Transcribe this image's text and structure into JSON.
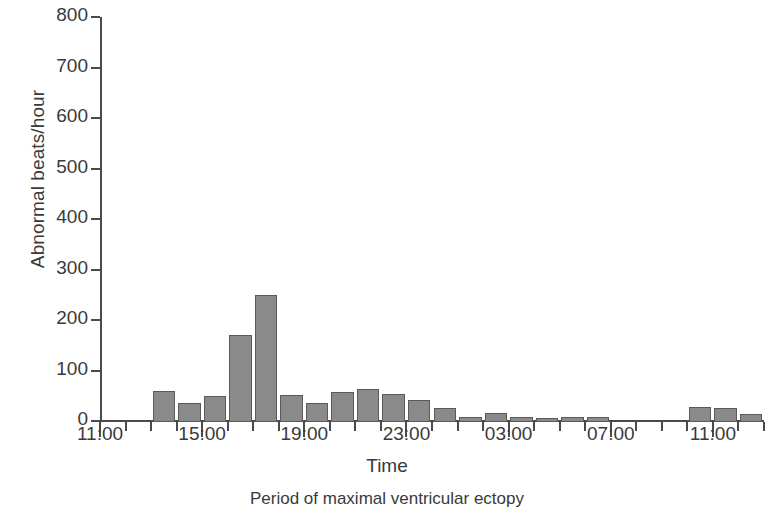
{
  "chart_data": {
    "type": "bar",
    "title": "",
    "xlabel": "Time",
    "ylabel": "Abnormal beats/hour",
    "caption": "Period of maximal ventricular ectopy",
    "ylim": [
      0,
      800
    ],
    "ytick_labels": [
      "0",
      "100",
      "200",
      "300",
      "400",
      "500",
      "600",
      "700",
      "800"
    ],
    "ytick_values": [
      0,
      100,
      200,
      300,
      400,
      500,
      600,
      700,
      800
    ],
    "xtick_labels": [
      "11:00",
      "15:00",
      "19:00",
      "23:00",
      "03:00",
      "07:00",
      "11:00"
    ],
    "xtick_hours": [
      0,
      4,
      8,
      12,
      16,
      20,
      24
    ],
    "xlim_hours": [
      0,
      26
    ],
    "grid": false,
    "legend": null,
    "bar_color": "#8a8a8a",
    "bar_edge_color": "#5a5a5a",
    "axis_color": "#4a4a4a",
    "categories": [
      "11:00",
      "12:00",
      "13:00",
      "14:00",
      "15:00",
      "16:00",
      "17:00",
      "18:00",
      "19:00",
      "20:00",
      "21:00",
      "22:00",
      "23:00",
      "00:00",
      "01:00",
      "02:00",
      "03:00",
      "04:00",
      "05:00",
      "06:00",
      "07:00",
      "08:00",
      "09:00",
      "10:00",
      "11:00",
      "12:00"
    ],
    "x": [
      0,
      1,
      2,
      3,
      4,
      5,
      6,
      7,
      8,
      9,
      10,
      11,
      12,
      13,
      14,
      15,
      16,
      17,
      18,
      19,
      20,
      21,
      22,
      23,
      24,
      25
    ],
    "values": [
      0,
      0,
      60,
      35,
      50,
      170,
      250,
      52,
      36,
      58,
      63,
      54,
      42,
      25,
      7,
      16,
      8,
      6,
      7,
      8,
      0,
      0,
      0,
      27,
      25,
      13
    ]
  }
}
